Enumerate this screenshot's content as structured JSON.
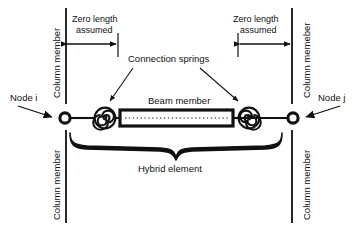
{
  "figure": {
    "type": "structural-engineering-schematic",
    "background_color": "#ffffff",
    "line_color": "#111111"
  },
  "labels": {
    "column_member_top_left": "Column member",
    "column_member_bottom_left": "Column member",
    "column_member_top_right": "Column memeber",
    "column_member_bottom_right": "Column member",
    "zero_length_left_line1": "Zero length",
    "zero_length_left_line2": "assumed",
    "zero_length_right_line1": "Zero length",
    "zero_length_right_line2": "assumed",
    "connection_springs": "Connection springs",
    "beam_member": "Beam member",
    "hybrid_element": "Hybrid element",
    "node_i": "Node i",
    "node_j": "Node j"
  },
  "elements": {
    "node_i_marker": "node-circle",
    "node_j_marker": "node-circle",
    "spring_left": "spiral-coil-spring",
    "spring_right": "spiral-coil-spring",
    "beam": "hollow-rectangle-with-dotted-centerline",
    "brace": "curly-brace-under-element",
    "dimension_left": "double-headed-arrow",
    "dimension_right": "double-headed-arrow"
  }
}
